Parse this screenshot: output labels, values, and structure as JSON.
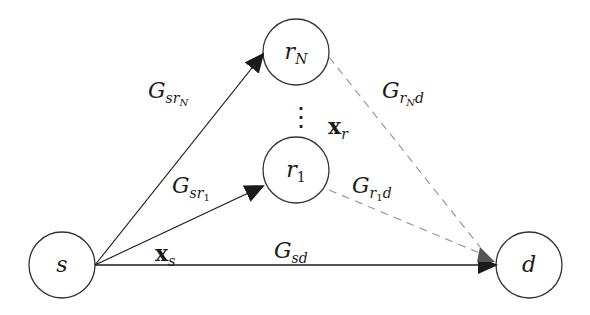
{
  "nodes": {
    "s": {
      "label": "s",
      "cx": 62,
      "cy": 265
    },
    "d": {
      "label": "d",
      "cx": 529,
      "cy": 265
    },
    "rN": {
      "label": "r",
      "sub": "N",
      "cx": 296,
      "cy": 52
    },
    "r1": {
      "label": "r",
      "sub": "1",
      "cx": 296,
      "cy": 170
    }
  },
  "edges": {
    "s_rN": {
      "main": "G",
      "sub": "sr",
      "subsub": "N"
    },
    "s_r1": {
      "main": "G",
      "sub": "sr",
      "subsub": "1"
    },
    "s_d": {
      "main": "G",
      "sub": "sd"
    },
    "rN_d": {
      "main": "G",
      "sub": "r",
      "subsub": "N",
      "tail": "d"
    },
    "r1_d": {
      "main": "G",
      "sub": "r",
      "subsub": "1",
      "tail": "d"
    }
  },
  "signals": {
    "xs": {
      "main": "x",
      "sub": "s"
    },
    "xr": {
      "main": "x",
      "sub": "r"
    }
  },
  "ellipsis": "⋮",
  "colors": {
    "line": "#1a1a1a",
    "dashed": "#999999",
    "arrow": "#333333"
  }
}
